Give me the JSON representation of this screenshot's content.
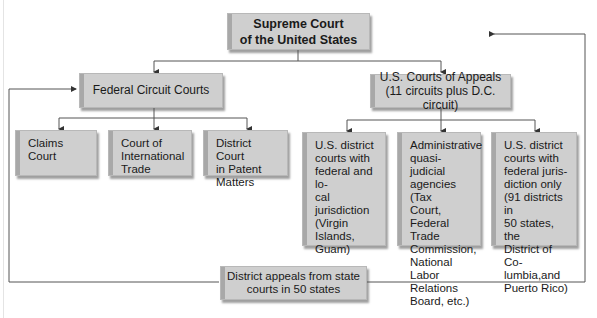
{
  "diagram": {
    "top": {
      "line1": "Supreme Court",
      "line2": "of the United States"
    },
    "federal_circuit": {
      "label": "Federal Circuit Courts"
    },
    "appeals": {
      "line1": "U.S. Courts of Appeals",
      "line2": "(11 circuits plus D.C. circuit)"
    },
    "fed_children": [
      {
        "lines": [
          "Claims Court"
        ]
      },
      {
        "lines": [
          "Court of",
          "International",
          "Trade"
        ]
      },
      {
        "lines": [
          "District Court",
          "in Patent",
          "Matters"
        ]
      }
    ],
    "appeals_children": [
      {
        "lines": [
          "U.S. district",
          "courts with",
          "federal and lo-",
          "cal jurisdiction",
          "(Virgin Islands,",
          "Guam)"
        ]
      },
      {
        "lines": [
          "Administrative",
          "quasi-judicial",
          "agencies (Tax",
          "Court, Federal",
          "Trade",
          "Commission,",
          "National Labor",
          "Relations",
          "Board, etc.)"
        ]
      },
      {
        "lines": [
          "U.S. district",
          "courts with",
          "federal juris-",
          "diction only",
          "(91 districts in",
          "50 states, the",
          "District of Co-",
          "lumbia,and",
          "Puerto Rico)"
        ]
      }
    ],
    "state": {
      "line1": "District appeals from state",
      "line2": "courts in 50 states"
    },
    "colors": {
      "box_fill": "#cfcfcf",
      "line": "#555555"
    }
  }
}
